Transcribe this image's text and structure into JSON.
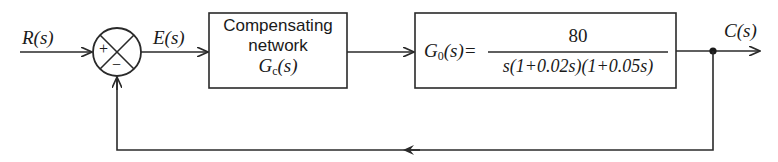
{
  "diagram": {
    "type": "feedback-control-block-diagram",
    "signals": {
      "input": "R(s)",
      "error": "E(s)",
      "output": "C(s)"
    },
    "summing_junction": {
      "plus_sign": "+",
      "minus_sign": "−"
    },
    "compensator": {
      "line1": "Compensating",
      "line2": "network",
      "symbol": "G",
      "symbol_sub": "c",
      "symbol_arg": "(s)"
    },
    "plant": {
      "lhs_symbol": "G",
      "lhs_sub": "0",
      "lhs_arg": "(s)=",
      "numerator": "80",
      "denominator": "s(1+0.02s)(1+0.05s)"
    },
    "colors": {
      "line": "#2a2a2a",
      "background": "#ffffff"
    }
  }
}
